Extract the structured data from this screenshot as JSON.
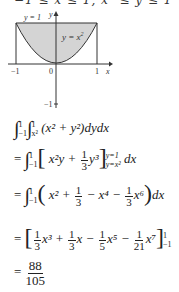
{
  "header": {
    "region_text": "−1 ≤ x ≤ 1, x² ≤ y ≤ 1"
  },
  "graph": {
    "label_y_eq_1": "y = 1",
    "label_y_eq_x2": "y = x",
    "label_y_eq_x2_exp": "2",
    "x_axis_label": "x",
    "y_axis_label": "y",
    "tick_neg1_x": "−1",
    "tick_0": "0",
    "tick_1_x": "1",
    "tick_neg1_y": "−1",
    "fill_color": "#d4d4d4",
    "line_color": "#333333"
  },
  "steps": {
    "s1": {
      "upper1": "1",
      "lower1": "−1",
      "upper2": "1",
      "lower2": "x²",
      "body": "(x² + y²)dydx"
    },
    "s2": {
      "prefix": "= ",
      "upper": "1",
      "lower": "−1",
      "bracket": "x²y + ",
      "frac_num": "1",
      "frac_den": "3",
      "after": "y³",
      "ub": "y=1",
      "lb": "y=x²",
      "tail": " dx"
    },
    "s3": {
      "prefix": "= ",
      "upper": "1",
      "lower": "−1",
      "t1": "x² + ",
      "f1n": "1",
      "f1d": "3",
      "t2": " − x⁴ − ",
      "f2n": "1",
      "f2d": "3",
      "t3": "x⁶",
      "tail": "dx"
    },
    "s4": {
      "prefix": "= ",
      "f1n": "1",
      "f1d": "3",
      "t1": "x³ + ",
      "f2n": "1",
      "f2d": "3",
      "t2": "x − ",
      "f3n": "1",
      "f3d": "5",
      "t3": "x⁵ − ",
      "f4n": "1",
      "f4d": "21",
      "t4": "x⁷",
      "ub": "1",
      "lb": "−1"
    },
    "s5": {
      "prefix": "= ",
      "num": "88",
      "den": "105"
    }
  }
}
